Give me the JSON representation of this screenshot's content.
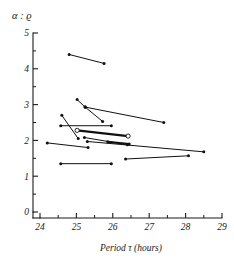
{
  "chart_data": {
    "type": "line",
    "title": "",
    "subtitle": "",
    "ylabel": "α : ϱ",
    "xlabel": "Period  τ  (hours)",
    "xlim": [
      24,
      29
    ],
    "ylim": [
      0,
      5
    ],
    "grid": false,
    "legend": null,
    "x_ticks": [
      24,
      25,
      26,
      27,
      28,
      29
    ],
    "x_tick_labels": [
      "24",
      "25",
      "26",
      "27",
      "28",
      "29"
    ],
    "x_minor_step": 0.5,
    "y_ticks": [
      0,
      1,
      2,
      3,
      4,
      5
    ],
    "y_tick_labels": [
      "0",
      "1",
      "2",
      "3",
      "4",
      "5"
    ],
    "y_minor_step": 0.5,
    "marker_styles": {
      "filled": "filled-dot",
      "open": "open-circle"
    },
    "segments": [
      {
        "id": "seg-1",
        "x": [
          24.8,
          25.76
        ],
        "y": [
          4.4,
          4.15
        ],
        "markers": [
          "filled",
          "filled"
        ],
        "weight": "normal"
      },
      {
        "id": "seg-2",
        "x": [
          25.02,
          25.24
        ],
        "y": [
          3.14,
          2.93
        ],
        "markers": [
          "filled",
          "filled"
        ],
        "weight": "normal"
      },
      {
        "id": "seg-3",
        "x": [
          25.24,
          25.72
        ],
        "y": [
          2.93,
          2.53
        ],
        "markers": [
          "filled",
          "filled"
        ],
        "weight": "normal"
      },
      {
        "id": "seg-4",
        "x": [
          25.24,
          27.4
        ],
        "y": [
          2.93,
          2.5
        ],
        "markers": [
          "filled",
          "filled"
        ],
        "weight": "normal"
      },
      {
        "id": "seg-5",
        "x": [
          24.6,
          25.05
        ],
        "y": [
          2.7,
          2.05
        ],
        "markers": [
          "filled",
          "filled"
        ],
        "weight": "normal"
      },
      {
        "id": "seg-6",
        "x": [
          24.57,
          25.96
        ],
        "y": [
          2.41,
          2.41
        ],
        "markers": [
          "filled",
          "filled"
        ],
        "weight": "normal"
      },
      {
        "id": "seg-7",
        "x": [
          25.02,
          26.42
        ],
        "y": [
          2.28,
          2.12
        ],
        "markers": [
          "open",
          "open"
        ],
        "weight": "thick"
      },
      {
        "id": "seg-8",
        "x": [
          25.22,
          26.4
        ],
        "y": [
          2.08,
          1.88
        ],
        "markers": [
          "filled",
          "filled"
        ],
        "weight": "normal"
      },
      {
        "id": "seg-9",
        "x": [
          25.86,
          26.45
        ],
        "y": [
          1.96,
          1.9
        ],
        "markers": [
          "filled",
          "filled"
        ],
        "weight": "thick"
      },
      {
        "id": "seg-10",
        "x": [
          24.2,
          25.32
        ],
        "y": [
          1.93,
          1.8
        ],
        "markers": [
          "filled",
          "filled"
        ],
        "weight": "normal"
      },
      {
        "id": "seg-11",
        "x": [
          25.3,
          28.5
        ],
        "y": [
          1.97,
          1.68
        ],
        "markers": [
          "filled",
          "filled"
        ],
        "weight": "normal"
      },
      {
        "id": "seg-12",
        "x": [
          26.35,
          28.08
        ],
        "y": [
          1.48,
          1.57
        ],
        "markers": [
          "filled",
          "filled"
        ],
        "weight": "normal"
      },
      {
        "id": "seg-13",
        "x": [
          24.57,
          25.96
        ],
        "y": [
          1.35,
          1.35
        ],
        "markers": [
          "filled",
          "filled"
        ],
        "weight": "normal"
      }
    ]
  }
}
